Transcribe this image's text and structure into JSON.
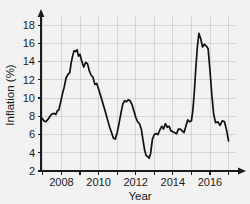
{
  "chart_data": {
    "type": "line",
    "title": "",
    "xlabel": "Year",
    "ylabel": "Inflation (%)",
    "xlim": [
      2006.9,
      2017.4
    ],
    "ylim": [
      2,
      19
    ],
    "grid": true,
    "legend": null,
    "x_major_ticks": [
      2008,
      2010,
      2012,
      2014,
      2016
    ],
    "x_minor_ticks": [
      2007,
      2009,
      2011,
      2013,
      2015,
      2017
    ],
    "x_tick_labels": [
      "2008",
      "2010",
      "2012",
      "2014",
      "2016"
    ],
    "y_ticks": [
      2,
      4,
      6,
      8,
      10,
      12,
      14,
      16,
      18
    ],
    "y_tick_labels": [
      "2",
      "4",
      "6",
      "8",
      "10",
      "12",
      "14",
      "16",
      "18"
    ],
    "series": [
      {
        "name": "Inflation",
        "color": "#111111",
        "x": [
          2006.95,
          2007.05,
          2007.15,
          2007.25,
          2007.35,
          2007.45,
          2007.55,
          2007.62,
          2007.7,
          2007.78,
          2007.86,
          2007.95,
          2008.05,
          2008.15,
          2008.25,
          2008.35,
          2008.45,
          2008.52,
          2008.6,
          2008.68,
          2008.76,
          2008.84,
          2008.92,
          2009.0,
          2009.1,
          2009.2,
          2009.3,
          2009.4,
          2009.5,
          2009.6,
          2009.7,
          2009.8,
          2009.9,
          2010.0,
          2010.12,
          2010.25,
          2010.38,
          2010.5,
          2010.6,
          2010.7,
          2010.8,
          2010.9,
          2011.0,
          2011.1,
          2011.2,
          2011.3,
          2011.4,
          2011.5,
          2011.6,
          2011.7,
          2011.8,
          2011.9,
          2012.0,
          2012.1,
          2012.2,
          2012.3,
          2012.4,
          2012.48,
          2012.56,
          2012.64,
          2012.72,
          2012.8,
          2012.9,
          2013.0,
          2013.1,
          2013.2,
          2013.3,
          2013.4,
          2013.5,
          2013.6,
          2013.7,
          2013.8,
          2013.9,
          2014.0,
          2014.1,
          2014.2,
          2014.3,
          2014.4,
          2014.5,
          2014.6,
          2014.7,
          2014.8,
          2014.9,
          2015.0,
          2015.08,
          2015.16,
          2015.24,
          2015.32,
          2015.4,
          2015.5,
          2015.6,
          2015.7,
          2015.8,
          2015.9,
          2016.0,
          2016.1,
          2016.2,
          2016.3,
          2016.42,
          2016.54,
          2016.66,
          2016.78,
          2016.9,
          2017.0
        ],
        "y": [
          7.8,
          7.5,
          7.4,
          7.6,
          7.9,
          8.2,
          8.3,
          8.3,
          8.2,
          8.6,
          8.7,
          9.5,
          10.4,
          11.2,
          12.2,
          12.6,
          12.8,
          13.8,
          14.6,
          15.2,
          15.1,
          15.3,
          14.6,
          14.8,
          14.0,
          13.4,
          13.9,
          13.8,
          13.0,
          12.5,
          12.3,
          11.5,
          11.6,
          11.0,
          10.2,
          9.3,
          8.4,
          7.5,
          6.8,
          6.2,
          5.6,
          5.5,
          6.2,
          7.2,
          8.3,
          9.3,
          9.7,
          9.6,
          9.8,
          9.7,
          9.3,
          8.6,
          7.9,
          7.4,
          7.2,
          6.6,
          5.3,
          4.3,
          3.7,
          3.6,
          3.4,
          3.9,
          5.5,
          6.0,
          6.1,
          6.0,
          6.5,
          6.9,
          6.6,
          7.2,
          6.8,
          6.9,
          6.4,
          6.3,
          6.2,
          6.1,
          6.6,
          6.6,
          6.4,
          6.2,
          6.9,
          7.6,
          7.4,
          7.5,
          8.7,
          10.8,
          13.4,
          15.6,
          17.1,
          16.5,
          15.6,
          15.9,
          15.7,
          15.4,
          13.0,
          10.3,
          8.2,
          7.3,
          7.4,
          7.0,
          7.5,
          7.4,
          6.4,
          5.3
        ]
      }
    ]
  },
  "axis": {
    "xlabel": "Year",
    "ylabel": "Inflation (%)"
  }
}
